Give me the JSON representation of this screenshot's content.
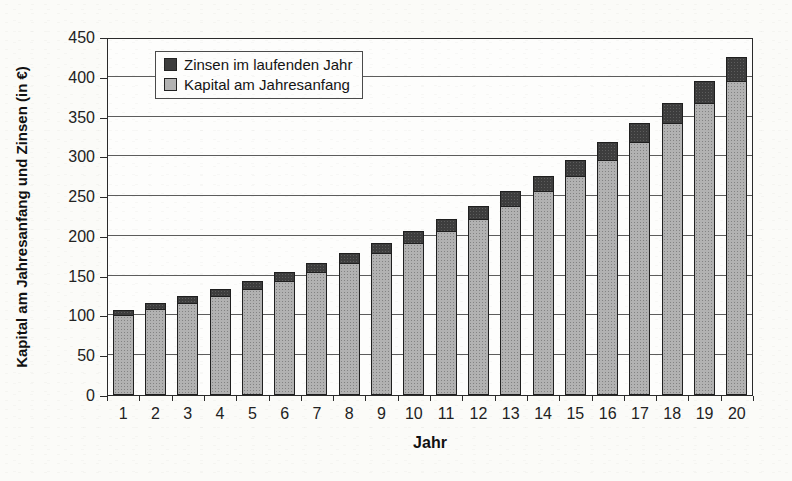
{
  "figure": {
    "background_color": "#fbfbf8",
    "plot_background_color": "#fdfdfc",
    "plot_border_color": "#2a2a2a",
    "gridline_color": "#5c5c5c"
  },
  "chart_data": {
    "type": "bar",
    "stacked": true,
    "xlabel": "Jahr",
    "ylabel": "Kapital am Jahresanfang und Zinsen (in €)",
    "categories": [
      "1",
      "2",
      "3",
      "4",
      "5",
      "6",
      "7",
      "8",
      "9",
      "10",
      "11",
      "12",
      "13",
      "14",
      "15",
      "16",
      "17",
      "18",
      "19",
      "20"
    ],
    "series": [
      {
        "name": "Kapital am Jahresanfang",
        "color": "#b2b2b2",
        "values": [
          100.0,
          107.5,
          115.6,
          124.2,
          133.6,
          143.6,
          154.3,
          165.9,
          178.3,
          191.7,
          206.1,
          221.6,
          238.2,
          256.0,
          275.2,
          295.9,
          318.1,
          341.9,
          367.6,
          395.1
        ]
      },
      {
        "name": "Zinsen im laufenden Jahr",
        "color": "#3d3d3d",
        "values": [
          7.5,
          8.1,
          8.7,
          9.3,
          10.0,
          10.8,
          11.6,
          12.4,
          13.4,
          14.4,
          15.5,
          16.6,
          17.9,
          19.2,
          20.6,
          22.2,
          23.9,
          25.7,
          27.6,
          29.6
        ]
      }
    ],
    "ylim": [
      0,
      450
    ],
    "yticks": [
      0,
      50,
      100,
      150,
      200,
      250,
      300,
      350,
      400,
      450
    ],
    "grid": true,
    "legend_position": "top-left-inside"
  },
  "legend": {
    "items": [
      {
        "label": "Zinsen im laufenden Jahr",
        "color": "#3d3d3d"
      },
      {
        "label": "Kapital am Jahresanfang",
        "color": "#b2b2b2"
      }
    ]
  }
}
